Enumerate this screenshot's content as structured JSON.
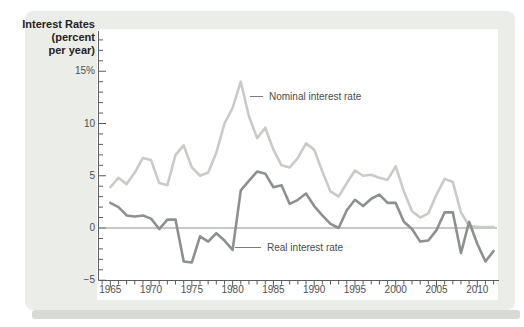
{
  "figure": {
    "kind": "textbook-chart-panel",
    "annotation_nominal": "Nominal interest rate",
    "annotation_real": "Real interest rate"
  },
  "colors": {
    "panel_bg": "#ebede8",
    "panel_shadow": "#d8dad5",
    "plot_bg": "#ffffff",
    "axis": "#5a5c5d",
    "tick_text": "#4e5052",
    "title_text": "#232323",
    "zero_line": "#8f918f",
    "nominal_line": "#c8ccc6",
    "real_line": "#8d918e",
    "annotation_dash": "#7a7e7b"
  },
  "chart_data": {
    "type": "line",
    "title": "Interest Rates (percent per year)",
    "title_lines": [
      "Interest Rates",
      "(percent",
      "per year)"
    ],
    "xlabel": "",
    "ylabel": "Interest Rates (percent per year)",
    "xlim": [
      1964,
      2012
    ],
    "ylim": [
      -5,
      18
    ],
    "grid": false,
    "zero_line": true,
    "legend_position": "inline-annotations",
    "x": [
      1965,
      1966,
      1967,
      1968,
      1969,
      1970,
      1971,
      1972,
      1973,
      1974,
      1975,
      1976,
      1977,
      1978,
      1979,
      1980,
      1981,
      1982,
      1983,
      1984,
      1985,
      1986,
      1987,
      1988,
      1989,
      1990,
      1991,
      1992,
      1993,
      1994,
      1995,
      1996,
      1997,
      1998,
      1999,
      2000,
      2001,
      2002,
      2003,
      2004,
      2005,
      2006,
      2007,
      2008,
      2009,
      2010,
      2011,
      2012
    ],
    "series": [
      {
        "name": "Nominal interest rate",
        "color": "#c8ccc6",
        "values": [
          3.9,
          4.8,
          4.2,
          5.3,
          6.7,
          6.5,
          4.3,
          4.1,
          7.0,
          7.9,
          5.8,
          5.0,
          5.3,
          7.2,
          10.0,
          11.5,
          14.0,
          10.7,
          8.6,
          9.6,
          7.5,
          6.0,
          5.8,
          6.7,
          8.1,
          7.5,
          5.4,
          3.5,
          3.0,
          4.3,
          5.5,
          5.0,
          5.1,
          4.8,
          4.6,
          5.9,
          3.5,
          1.6,
          1.0,
          1.4,
          3.2,
          4.7,
          4.4,
          1.5,
          0.2,
          0.1,
          0.1,
          0.1
        ]
      },
      {
        "name": "Real interest rate",
        "color": "#8d918e",
        "values": [
          2.4,
          2.0,
          1.2,
          1.1,
          1.2,
          0.9,
          -0.1,
          0.8,
          0.8,
          -3.2,
          -3.3,
          -0.8,
          -1.3,
          -0.5,
          -1.2,
          -2.1,
          3.6,
          4.5,
          5.4,
          5.2,
          3.9,
          4.1,
          2.3,
          2.7,
          3.3,
          2.1,
          1.2,
          0.4,
          0.0,
          1.7,
          2.7,
          2.1,
          2.8,
          3.2,
          2.4,
          2.4,
          0.6,
          -0.1,
          -1.3,
          -1.2,
          -0.2,
          1.5,
          1.5,
          -2.4,
          0.6,
          -1.5,
          -3.2,
          -2.2
        ]
      }
    ],
    "y_ticks": [
      {
        "value": 15,
        "label": "15%"
      },
      {
        "value": 10,
        "label": "10"
      },
      {
        "value": 5,
        "label": "5"
      },
      {
        "value": 0,
        "label": "0"
      },
      {
        "value": -5,
        "label": "−5"
      }
    ],
    "x_ticks": [
      1965,
      1970,
      1975,
      1980,
      1985,
      1990,
      1995,
      2000,
      2005,
      2010
    ],
    "x_minor_step": 1,
    "y_minor_step": 1,
    "x_major_step": 5,
    "y_major_step": 5
  }
}
